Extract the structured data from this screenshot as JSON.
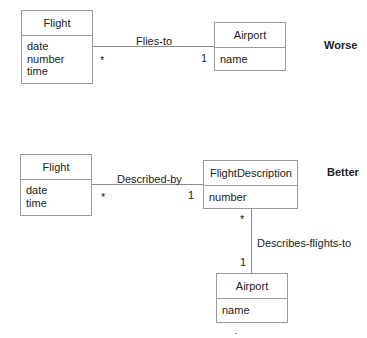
{
  "worse": {
    "tag": "Worse",
    "flight": {
      "name": "Flight",
      "attributes": [
        "date",
        "number",
        "time"
      ]
    },
    "airport": {
      "name": "Airport",
      "attributes": [
        "name"
      ]
    },
    "association": {
      "label": "Flies-to",
      "flight_multiplicity": "*",
      "airport_multiplicity": "1"
    }
  },
  "better": {
    "tag": "Better",
    "flight": {
      "name": "Flight",
      "attributes": [
        "date",
        "time"
      ]
    },
    "flight_description": {
      "name": "FlightDescription",
      "attributes": [
        "number"
      ]
    },
    "airport": {
      "name": "Airport",
      "attributes": [
        "name"
      ]
    },
    "described_by": {
      "label": "Described-by",
      "flight_multiplicity": "*",
      "description_multiplicity": "1"
    },
    "describes_flights_to": {
      "label": "Describes-flights-to",
      "description_multiplicity": "*",
      "airport_multiplicity": "1"
    }
  }
}
